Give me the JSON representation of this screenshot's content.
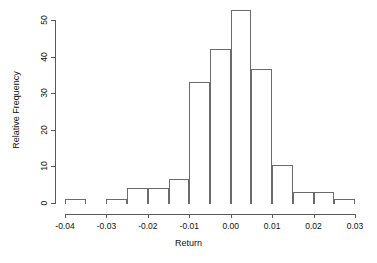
{
  "chart_data": {
    "type": "bar",
    "title": "",
    "subtitle": "",
    "xlabel": "Return",
    "ylabel": "Relative Frequency",
    "xlim": [
      -0.04,
      0.03
    ],
    "ylim": [
      0,
      53
    ],
    "grid": false,
    "legend": null,
    "legend_position": "none",
    "bin_width": 0.005,
    "bin_edges": [
      -0.04,
      -0.035,
      -0.03,
      -0.025,
      -0.02,
      -0.015,
      -0.01,
      -0.005,
      0.0,
      0.005,
      0.01,
      0.015,
      0.02,
      0.025,
      0.03
    ],
    "categories": [
      "-0.040 to -0.035",
      "-0.035 to -0.030",
      "-0.030 to -0.025",
      "-0.025 to -0.020",
      "-0.020 to -0.015",
      "-0.015 to -0.010",
      "-0.010 to -0.005",
      "-0.005 to 0.000",
      "0.000 to 0.005",
      "0.005 to 0.010",
      "0.010 to 0.015",
      "0.015 to 0.020",
      "0.020 to 0.025",
      "0.025 to 0.030"
    ],
    "values": [
      1,
      0,
      1,
      4.2,
      4.2,
      6.5,
      33,
      42,
      52.7,
      36.5,
      10.5,
      3,
      3,
      1
    ],
    "xticks": [
      -0.04,
      -0.03,
      -0.02,
      -0.01,
      0.0,
      0.01,
      0.02,
      0.03
    ],
    "xticklabels": [
      "-0.04",
      "-0.03",
      "-0.02",
      "-0.01",
      "0.00",
      "0.01",
      "0.02",
      "0.03"
    ],
    "yticks": [
      0,
      10,
      20,
      30,
      40,
      50
    ],
    "yticklabels": [
      "0",
      "10",
      "20",
      "30",
      "40",
      "50"
    ],
    "colors": {
      "bar_edge": "#6b6b6b",
      "bar_fill": "transparent",
      "axis": "#5a5a5a",
      "text": "#111111",
      "background": "#ffffff"
    }
  }
}
